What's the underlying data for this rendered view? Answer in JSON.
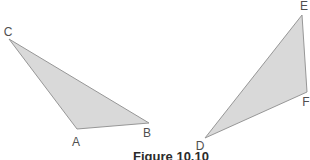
{
  "figure": {
    "caption": "Figure 10.10",
    "colors": {
      "background": "#ffffff",
      "triangle_fill": "#d9d9d9",
      "triangle_stroke": "#979797",
      "label_text": "#4f4f4f"
    },
    "triangles": [
      {
        "name": "ABC",
        "points": "9,39 77,129 149,123",
        "labels": [
          {
            "text": "C"
          },
          {
            "text": "A"
          },
          {
            "text": "B"
          }
        ]
      },
      {
        "name": "DEF",
        "points": "302,15 307,92 205,138",
        "labels": [
          {
            "text": "E"
          },
          {
            "text": "F"
          },
          {
            "text": "D"
          }
        ]
      }
    ]
  }
}
